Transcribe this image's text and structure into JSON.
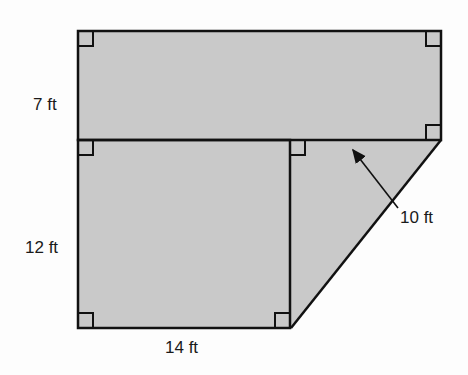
{
  "diagram": {
    "type": "composite-figure",
    "fill_color": "#c9c9c9",
    "stroke_color": "#111111",
    "labels": {
      "top_height": "7 ft",
      "left_height": "12 ft",
      "bottom_width": "14 ft",
      "slant_height": "10 ft"
    },
    "shapes": [
      {
        "name": "top-rectangle",
        "kind": "rectangle"
      },
      {
        "name": "bottom-square",
        "kind": "rectangle"
      },
      {
        "name": "triangle",
        "kind": "right-triangle"
      }
    ]
  }
}
